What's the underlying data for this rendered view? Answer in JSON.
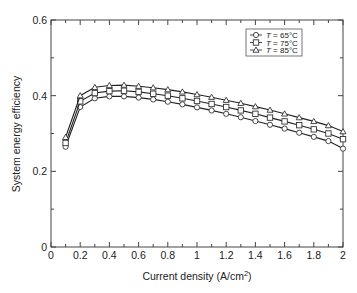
{
  "chart_data": {
    "type": "line",
    "title": "",
    "xlabel": "Current density (A/cm",
    "xlabel_sup": "2",
    "xlabel_end": ")",
    "ylabel": "System energy efficiency",
    "xlim": [
      0,
      2
    ],
    "ylim": [
      0,
      0.6
    ],
    "x_ticks": [
      "0",
      "0.2",
      "0.4",
      "0.6",
      "0.8",
      "1",
      "1.2",
      "1.4",
      "1.6",
      "1.8",
      "2"
    ],
    "y_ticks": [
      "0",
      "0.2",
      "0.4",
      "0.6"
    ],
    "grid": false,
    "legend_position": "upper right",
    "x": [
      0.1,
      0.2,
      0.3,
      0.4,
      0.5,
      0.6,
      0.7,
      0.8,
      0.9,
      1.0,
      1.1,
      1.2,
      1.3,
      1.4,
      1.5,
      1.6,
      1.7,
      1.8,
      1.9,
      2.0
    ],
    "series": [
      {
        "name": "T = 65°C",
        "label_italic": "T",
        "label_rest": " = 65°C",
        "marker": "circle",
        "values": [
          0.265,
          0.37,
          0.393,
          0.398,
          0.398,
          0.395,
          0.39,
          0.384,
          0.377,
          0.369,
          0.361,
          0.352,
          0.343,
          0.333,
          0.323,
          0.313,
          0.302,
          0.291,
          0.28,
          0.26
        ]
      },
      {
        "name": "T = 75°C",
        "label_italic": "T",
        "label_rest": " = 75°C",
        "marker": "square",
        "values": [
          0.275,
          0.385,
          0.407,
          0.412,
          0.413,
          0.41,
          0.405,
          0.4,
          0.393,
          0.386,
          0.378,
          0.37,
          0.361,
          0.352,
          0.342,
          0.332,
          0.322,
          0.311,
          0.3,
          0.285
        ]
      },
      {
        "name": "T = 85°C",
        "label_italic": "T",
        "label_rest": " = 85°C",
        "marker": "triangle",
        "values": [
          0.29,
          0.4,
          0.422,
          0.427,
          0.428,
          0.425,
          0.421,
          0.416,
          0.41,
          0.403,
          0.396,
          0.388,
          0.38,
          0.371,
          0.362,
          0.352,
          0.342,
          0.332,
          0.321,
          0.305
        ]
      }
    ]
  }
}
